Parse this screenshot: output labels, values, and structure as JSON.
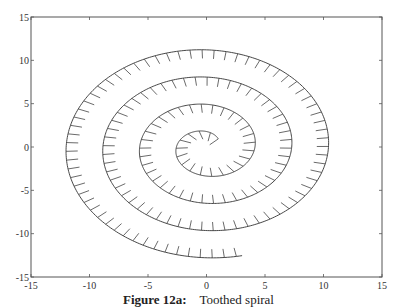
{
  "caption": {
    "figure_number": "Figure 12a:",
    "title": "Toothed spiral"
  },
  "colors": {
    "axes": "#555555",
    "curve": "#333333",
    "teeth": "#444444",
    "text": "#333333"
  },
  "chart_data": {
    "type": "line",
    "title": "Toothed spiral",
    "xlabel": "",
    "ylabel": "",
    "xlim": [
      -15,
      15
    ],
    "ylim": [
      -15,
      15
    ],
    "xticks": [
      -15,
      -10,
      -5,
      0,
      5,
      10,
      15
    ],
    "yticks": [
      -15,
      -10,
      -5,
      0,
      5,
      10,
      15
    ],
    "grid": false,
    "legend": null,
    "series": [
      {
        "name": "spiral",
        "kind": "archimedean-spiral",
        "equation": "r = theta/2 + 1",
        "theta_start": 0.75,
        "theta_end": 23.8,
        "direction": "counterclockwise",
        "start_point": [
          1.0,
          0.9
        ],
        "end_point": [
          2.8,
          -12.6
        ],
        "teeth": {
          "orientation": "inward",
          "spacing_units": 1.0,
          "length_units": 1.0
        },
        "sample_crossings": {
          "top_y": [
            1.8,
            5.0,
            8.0,
            11.2
          ],
          "bottom_y": [
            -3.4,
            -6.6,
            -9.8,
            -12.8
          ],
          "left_x": [
            -2.6,
            -5.9,
            -9.1,
            -12.2
          ],
          "right_x": [
            4.1,
            7.3,
            10.5
          ]
        }
      }
    ]
  },
  "plot_area": {
    "left": 31,
    "top": 17,
    "right": 382,
    "bottom": 277
  }
}
